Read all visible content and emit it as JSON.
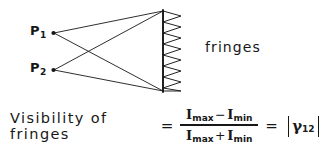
{
  "figure": {
    "kind": "hand-drawn optics diagram",
    "background_color": "#ffffff",
    "ink_color": "#171717"
  },
  "sources": [
    {
      "label": "P",
      "subscript": "1",
      "point_x": 52,
      "point_y": 33
    },
    {
      "label": "P",
      "subscript": "2",
      "point_x": 52,
      "point_y": 70
    }
  ],
  "screen": {
    "x": 163,
    "top_y": 11,
    "bottom_y": 91
  },
  "fringe_pattern": {
    "caption": "fringes",
    "peaks": 7,
    "amplitude_px": 18,
    "shape": "sawtooth"
  },
  "formula": {
    "lhs": "Visibility  of  fringes",
    "equals": "=",
    "numerator": {
      "left_symbol": "I",
      "left_subscript": "max",
      "operator": "−",
      "right_symbol": "I",
      "right_subscript": "min"
    },
    "denominator": {
      "left_symbol": "I",
      "left_subscript": "max",
      "operator": "+",
      "right_symbol": "I",
      "right_subscript": "min"
    },
    "equals2": "=",
    "result": {
      "open_bar": "|",
      "symbol": "γ",
      "subscript": "12",
      "close_bar": "|"
    }
  }
}
